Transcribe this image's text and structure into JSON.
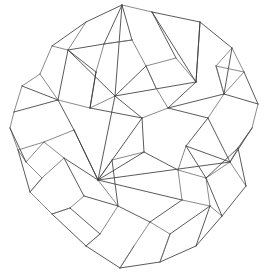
{
  "figure": {
    "background_color": "#ffffff",
    "stroke_color": "#3c3c3c",
    "stroke_color_heavy": "#1e1e1e",
    "stroke_color_light": "#585858",
    "stroke_width": 0.85,
    "width": 268,
    "height": 280,
    "vertex_count": 60,
    "edge_count": 120
  },
  "chart_data": {
    "type": "scatter",
    "xlabel": "",
    "ylabel": "",
    "grid": false,
    "legend": "none",
    "xlim": [
      0,
      268
    ],
    "ylim": [
      0,
      280
    ],
    "vertices": [
      [
        122,
        5
      ],
      [
        152,
        12
      ],
      [
        200,
        22
      ],
      [
        86,
        22
      ],
      [
        52,
        46
      ],
      [
        68,
        50
      ],
      [
        232,
        48
      ],
      [
        244,
        72
      ],
      [
        196,
        82
      ],
      [
        258,
        104
      ],
      [
        252,
        128
      ],
      [
        14,
        112
      ],
      [
        22,
        86
      ],
      [
        40,
        74
      ],
      [
        115,
        96
      ],
      [
        98,
        180
      ],
      [
        230,
        162
      ],
      [
        30,
        192
      ],
      [
        52,
        214
      ],
      [
        86,
        246
      ],
      [
        120,
        268
      ],
      [
        160,
        262
      ],
      [
        196,
        246
      ],
      [
        222,
        216
      ],
      [
        246,
        186
      ],
      [
        18,
        150
      ],
      [
        10,
        128
      ],
      [
        176,
        58
      ],
      [
        146,
        66
      ],
      [
        104,
        44
      ],
      [
        74,
        130
      ],
      [
        142,
        118
      ],
      [
        168,
        108
      ],
      [
        208,
        118
      ],
      [
        186,
        146
      ],
      [
        144,
        152
      ],
      [
        118,
        206
      ],
      [
        150,
        222
      ],
      [
        182,
        200
      ],
      [
        206,
        178
      ],
      [
        64,
        158
      ],
      [
        44,
        142
      ],
      [
        90,
        108
      ],
      [
        132,
        40
      ],
      [
        224,
        94
      ],
      [
        238,
        148
      ],
      [
        210,
        206
      ],
      [
        170,
        234
      ],
      [
        134,
        246
      ],
      [
        100,
        234
      ],
      [
        70,
        208
      ],
      [
        42,
        178
      ],
      [
        26,
        162
      ],
      [
        58,
        100
      ],
      [
        96,
        72
      ],
      [
        178,
        170
      ],
      [
        156,
        88
      ],
      [
        216,
        66
      ],
      [
        112,
        160
      ],
      [
        84,
        196
      ]
    ],
    "edges": [
      [
        0,
        3
      ],
      [
        0,
        1
      ],
      [
        1,
        2
      ],
      [
        2,
        6
      ],
      [
        6,
        7
      ],
      [
        7,
        9
      ],
      [
        9,
        10
      ],
      [
        10,
        16
      ],
      [
        16,
        24
      ],
      [
        24,
        23
      ],
      [
        23,
        22
      ],
      [
        22,
        21
      ],
      [
        21,
        20
      ],
      [
        20,
        19
      ],
      [
        19,
        18
      ],
      [
        18,
        17
      ],
      [
        17,
        25
      ],
      [
        25,
        26
      ],
      [
        26,
        11
      ],
      [
        11,
        12
      ],
      [
        12,
        13
      ],
      [
        13,
        4
      ],
      [
        4,
        3
      ],
      [
        4,
        5
      ],
      [
        5,
        29
      ],
      [
        29,
        0
      ],
      [
        5,
        14
      ],
      [
        14,
        0
      ],
      [
        14,
        8
      ],
      [
        8,
        2
      ],
      [
        8,
        27
      ],
      [
        27,
        1
      ],
      [
        27,
        28
      ],
      [
        28,
        14
      ],
      [
        28,
        56
      ],
      [
        56,
        32
      ],
      [
        32,
        8
      ],
      [
        32,
        33
      ],
      [
        33,
        44
      ],
      [
        44,
        7
      ],
      [
        44,
        57
      ],
      [
        57,
        6
      ],
      [
        33,
        16
      ],
      [
        33,
        34
      ],
      [
        34,
        39
      ],
      [
        39,
        16
      ],
      [
        34,
        55
      ],
      [
        55,
        38
      ],
      [
        38,
        46
      ],
      [
        46,
        23
      ],
      [
        55,
        35
      ],
      [
        35,
        31
      ],
      [
        31,
        14
      ],
      [
        31,
        32
      ],
      [
        35,
        58
      ],
      [
        58,
        15
      ],
      [
        15,
        14
      ],
      [
        15,
        30
      ],
      [
        30,
        53
      ],
      [
        53,
        5
      ],
      [
        30,
        41
      ],
      [
        41,
        52
      ],
      [
        52,
        25
      ],
      [
        41,
        40
      ],
      [
        40,
        15
      ],
      [
        40,
        59
      ],
      [
        59,
        50
      ],
      [
        50,
        18
      ],
      [
        59,
        36
      ],
      [
        36,
        15
      ],
      [
        36,
        37
      ],
      [
        37,
        48
      ],
      [
        48,
        20
      ],
      [
        37,
        38
      ],
      [
        38,
        15
      ],
      [
        15,
        16
      ],
      [
        16,
        45
      ],
      [
        45,
        10
      ],
      [
        45,
        39
      ],
      [
        39,
        46
      ],
      [
        46,
        47
      ],
      [
        47,
        21
      ],
      [
        47,
        37
      ],
      [
        36,
        49
      ],
      [
        49,
        19
      ],
      [
        49,
        50
      ],
      [
        51,
        17
      ],
      [
        51,
        40
      ],
      [
        52,
        51
      ],
      [
        53,
        42
      ],
      [
        42,
        14
      ],
      [
        42,
        54
      ],
      [
        54,
        5
      ],
      [
        54,
        29
      ],
      [
        29,
        43
      ],
      [
        43,
        0
      ],
      [
        43,
        28
      ],
      [
        11,
        53
      ],
      [
        12,
        53
      ],
      [
        13,
        53
      ],
      [
        3,
        5
      ],
      [
        1,
        8
      ],
      [
        2,
        8
      ],
      [
        6,
        44
      ],
      [
        9,
        44
      ],
      [
        10,
        45
      ],
      [
        26,
        52
      ],
      [
        25,
        41
      ],
      [
        17,
        51
      ],
      [
        18,
        50
      ],
      [
        19,
        49
      ],
      [
        20,
        48
      ],
      [
        21,
        47
      ],
      [
        22,
        46
      ],
      [
        23,
        39
      ],
      [
        24,
        45
      ],
      [
        7,
        57
      ],
      [
        34,
        16
      ],
      [
        35,
        15
      ],
      [
        31,
        15
      ],
      [
        56,
        28
      ],
      [
        58,
        36
      ],
      [
        30,
        15
      ],
      [
        42,
        31
      ],
      [
        54,
        42
      ],
      [
        43,
        29
      ],
      [
        55,
        39
      ],
      [
        57,
        44
      ],
      [
        44,
        32
      ]
    ]
  }
}
